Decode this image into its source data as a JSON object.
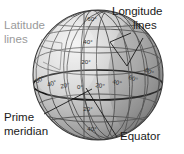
{
  "diagram": {
    "background_color": "#ffffff",
    "globe": {
      "center_x": 98,
      "center_y": 75,
      "radius": 65,
      "outline_color": "#3a3a3a",
      "light_color": "#e8e8e8",
      "shade_color": "#8f8f8f"
    },
    "callouts": [
      {
        "id": "latitude-lines",
        "label_line1": "Latitude",
        "label_line2": "lines",
        "color": "#9a9a9a",
        "text_x": 4,
        "text_y1": 26,
        "text_y2": 40
      },
      {
        "id": "longitude-lines",
        "label_line1": "Longitude",
        "label_line2": "lines",
        "color": "#1a1a1a",
        "text_x": 112,
        "text_y1": 12,
        "text_y2": 26
      },
      {
        "id": "prime-meridian",
        "label_line1": "Prime",
        "label_line2": "meridian",
        "color": "#1a1a1a",
        "text_x": 4,
        "text_y1": 118,
        "text_y2": 132
      },
      {
        "id": "equator",
        "label_line1": "Equator",
        "label_line2": "",
        "color": "#1a1a1a",
        "text_x": 120,
        "text_y1": 137,
        "text_y2": 0
      }
    ],
    "grid_labels": {
      "latitude_north": [
        {
          "value": "60°",
          "x": 92,
          "y": 19
        },
        {
          "value": "40°",
          "x": 88,
          "y": 42
        },
        {
          "value": "20°",
          "x": 86,
          "y": 62
        }
      ],
      "latitude_south": [
        {
          "value": "20°",
          "x": 88,
          "y": 109
        },
        {
          "value": "40°",
          "x": 92,
          "y": 129
        }
      ],
      "longitude_west": [
        {
          "value": "60°",
          "x": 40,
          "y": 80
        },
        {
          "value": "40°",
          "x": 52,
          "y": 84
        },
        {
          "value": "20°",
          "x": 65,
          "y": 86
        }
      ],
      "longitude_prime": [
        {
          "value": "0°",
          "x": 80,
          "y": 87
        }
      ],
      "longitude_east": [
        {
          "value": "20°",
          "x": 100,
          "y": 86
        },
        {
          "value": "40°",
          "x": 117,
          "y": 83
        },
        {
          "value": "60°",
          "x": 133,
          "y": 79
        },
        {
          "value": "80°",
          "x": 148,
          "y": 73
        }
      ]
    }
  }
}
